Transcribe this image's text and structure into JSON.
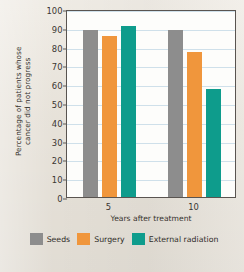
{
  "chart_data": {
    "type": "bar",
    "title": "",
    "xlabel": "Years after treatment",
    "ylabel_line1": "Percentage of patients whose",
    "ylabel_line2": "cancer did not progress",
    "categories": [
      "5",
      "10"
    ],
    "series": [
      {
        "name": "Seeds",
        "color": "#8d8d8d",
        "values": [
          89,
          89
        ]
      },
      {
        "name": "Surgery",
        "color": "#f0963c",
        "values": [
          85.5,
          77
        ]
      },
      {
        "name": "External radiation",
        "color": "#0e9c8c",
        "values": [
          91,
          57.5
        ]
      }
    ],
    "ylim": [
      0,
      100
    ],
    "ytick_labels": [
      "0",
      "10",
      "20",
      "30",
      "40",
      "50",
      "60",
      "70",
      "80",
      "90",
      "100"
    ],
    "ytick_values": [
      0,
      10,
      20,
      30,
      40,
      50,
      60,
      70,
      80,
      90,
      100
    ],
    "grid": true,
    "grid_color": "#cfe0ea",
    "legend_position": "bottom",
    "plot_background": "#fdfdfb",
    "page_background": "#eae5dc"
  }
}
